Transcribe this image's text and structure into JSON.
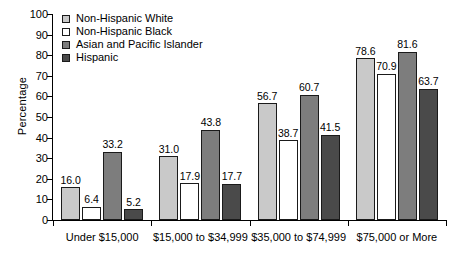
{
  "chart_data": {
    "type": "bar",
    "title": "",
    "xlabel": "",
    "ylabel": "Percentage",
    "ylim": [
      0,
      100
    ],
    "ytick_step": 10,
    "yticks": [
      0,
      10,
      20,
      30,
      40,
      50,
      60,
      70,
      80,
      90,
      100
    ],
    "grid": false,
    "legend_position": "top-left",
    "categories": [
      "Under $15,000",
      "$15,000 to $34,999",
      "$35,000 to $74,999",
      "$75,000 or More"
    ],
    "series": [
      {
        "name": "Non-Hispanic White",
        "color": "#c9c9c9",
        "values": [
          16.0,
          31.0,
          56.7,
          78.6
        ],
        "labels": [
          "16.0",
          "31.0",
          "56.7",
          "78.6"
        ]
      },
      {
        "name": "Non-Hispanic Black",
        "color": "#ffffff",
        "values": [
          6.4,
          17.9,
          38.7,
          70.9
        ],
        "labels": [
          "6.4",
          "17.9",
          "38.7",
          "70.9"
        ]
      },
      {
        "name": "Asian and Pacific Islander",
        "color": "#7d7d7d",
        "values": [
          33.2,
          43.8,
          60.7,
          81.6
        ],
        "labels": [
          "33.2",
          "43.8",
          "60.7",
          "81.6"
        ]
      },
      {
        "name": "Hispanic",
        "color": "#4a4a4a",
        "values": [
          5.2,
          17.7,
          41.5,
          63.7
        ],
        "labels": [
          "5.2",
          "17.7",
          "41.5",
          "63.7"
        ]
      }
    ]
  },
  "axis": {
    "y_title": "Percentage",
    "y_labels": [
      "100",
      "90",
      "80",
      "70",
      "60",
      "50",
      "40",
      "30",
      "20",
      "10",
      "0"
    ]
  }
}
